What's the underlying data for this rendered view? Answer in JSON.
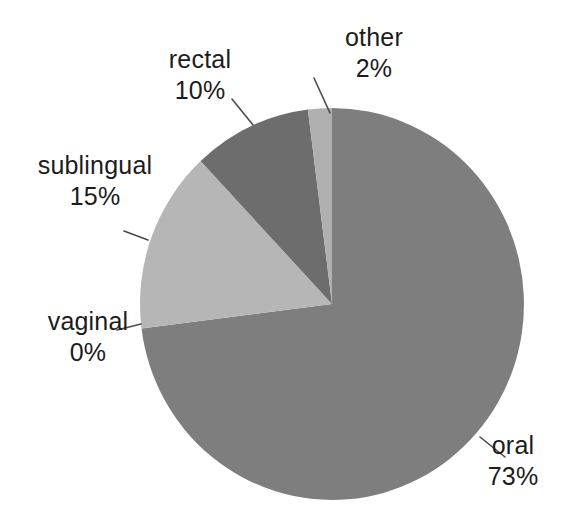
{
  "chart_data": {
    "type": "pie",
    "title": "",
    "subtitle": "",
    "xlabel": "",
    "ylabel": "",
    "legend_position": "none",
    "grid": false,
    "label_format": "name + percent",
    "start_angle_deg": 0,
    "direction": "clockwise",
    "categories": [
      "oral",
      "vaginal",
      "sublingual",
      "rectal",
      "other"
    ],
    "values": [
      73,
      0,
      15,
      10,
      2
    ],
    "units": "%",
    "slices": [
      {
        "name": "oral",
        "percent": 73,
        "value_label": "73%",
        "color": "#7e7e7e",
        "start_deg": 0,
        "end_deg": 262.8,
        "leader_line": true
      },
      {
        "name": "vaginal",
        "percent": 0,
        "value_label": "0%",
        "color": "#7e7e7e",
        "start_deg": 262.8,
        "end_deg": 262.8,
        "leader_line": true
      },
      {
        "name": "sublingual",
        "percent": 15,
        "value_label": "15%",
        "color": "#b6b6b6",
        "start_deg": 262.8,
        "end_deg": 316.8,
        "leader_line": true
      },
      {
        "name": "rectal",
        "percent": 10,
        "value_label": "10%",
        "color": "#6d6d6d",
        "start_deg": 316.8,
        "end_deg": 352.8,
        "leader_line": true
      },
      {
        "name": "other",
        "percent": 2,
        "value_label": "2%",
        "color": "#b0b0b0",
        "start_deg": 352.8,
        "end_deg": 360,
        "leader_line": true
      }
    ]
  },
  "labels": {
    "oral": {
      "name": "oral",
      "value": "73%"
    },
    "vaginal": {
      "name": "vaginal",
      "value": "0%"
    },
    "sublingual": {
      "name": "sublingual",
      "value": "15%"
    },
    "rectal": {
      "name": "rectal",
      "value": "10%"
    },
    "other": {
      "name": "other",
      "value": "2%"
    }
  },
  "colors": {
    "background": "#ffffff",
    "text": "#1c1c1c",
    "leader_line": "#4a4a4a",
    "oral": "#7e7e7e",
    "vaginal": "#7e7e7e",
    "sublingual": "#b6b6b6",
    "rectal": "#6d6d6d",
    "other": "#b0b0b0"
  }
}
